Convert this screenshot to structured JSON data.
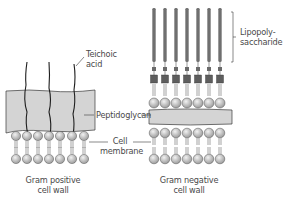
{
  "diagram": {
    "labels": {
      "teichoic_acid_line1": "Teichoic",
      "teichoic_acid_line2": "acid",
      "lps_line1": "Lipopoly-",
      "lps_line2": "saccharide",
      "peptidoglycan": "Peptidoglycan",
      "cell_membrane_line1": "Cell",
      "cell_membrane_line2": "membrane",
      "gram_positive_line1": "Gram positive",
      "gram_positive_line2": "cell wall",
      "gram_negative_line1": "Gram negative",
      "gram_negative_line2": "cell wall"
    },
    "colors": {
      "peptidoglycan_fill": "#d4d4d4",
      "outline": "#3a3a3a",
      "lipid_head": "#c8c8c8",
      "lps_rod": "#5a5a5a",
      "label_text": "#4a4a4a"
    },
    "gram_positive": {
      "phospholipid_count_per_leaflet": 7,
      "teichoic_acid_count": 3
    },
    "gram_negative": {
      "lps_count": 7,
      "phospholipid_count_per_leaflet": 7
    }
  }
}
